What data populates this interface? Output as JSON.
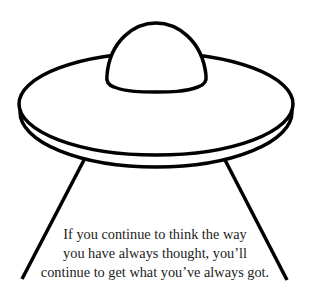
{
  "illustration": {
    "subject": "ufo-saucer-with-beam",
    "stroke_color": "#000000",
    "fill_color": "#ffffff"
  },
  "quote": {
    "lines": [
      "If you continue to think the way",
      "you have always thought, you’ll",
      "continue to get what you’ve always got."
    ],
    "color": "#222222"
  }
}
